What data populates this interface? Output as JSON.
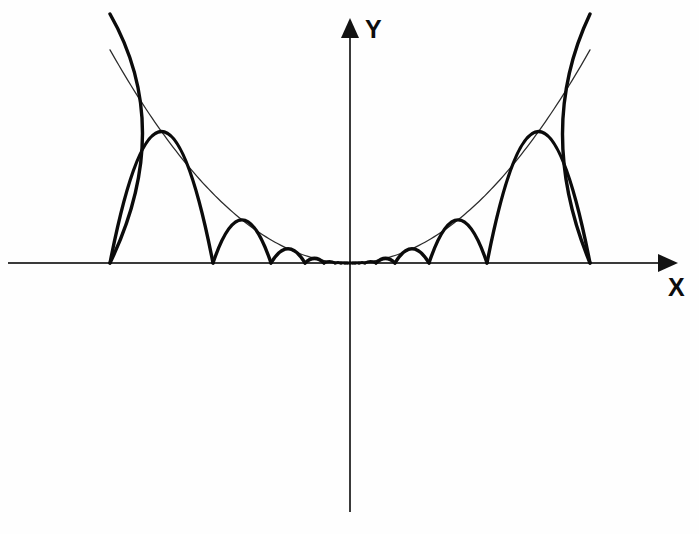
{
  "figure": {
    "background_color": "#fefefe",
    "width": 699,
    "height": 534
  },
  "axes": {
    "origin": {
      "x": 350,
      "y": 263
    },
    "x_axis": {
      "label": "X",
      "label_position": {
        "x": 668,
        "y": 296
      },
      "start": {
        "x": 8,
        "y": 263
      },
      "end": {
        "x": 678,
        "y": 263
      },
      "color": "#3a3a3a",
      "arrow": "right",
      "arrow_tip": {
        "x": 678,
        "y": 263
      }
    },
    "y_axis": {
      "label": "Y",
      "label_position": {
        "x": 365,
        "y": 38
      },
      "start": {
        "x": 350,
        "y": 512
      },
      "end": {
        "x": 350,
        "y": 18
      },
      "color": "#3a3a3a",
      "arrow": "up",
      "arrow_tip": {
        "x": 350,
        "y": 18
      }
    }
  },
  "chart_data": {
    "type": "line",
    "xlabel": "X",
    "ylabel": "Y",
    "grid": false,
    "legend": "none",
    "origin_px": {
      "x": 350,
      "y": 263
    },
    "envelope": {
      "name": "envelope parabola",
      "equation": "y = a * x^2",
      "curvature_a_px": 0.0037,
      "stroke_color": "#2b2b2b",
      "stroke_width": 1.25,
      "x_extent_px": [
        -240,
        240
      ],
      "vertex_px": {
        "x": 350,
        "y": 263
      }
    },
    "arc_chain": {
      "name": "self-similar arc chain",
      "stroke_color": "#0b0b0b",
      "stroke_width": 3.4,
      "geometric_ratio": 0.58,
      "cusp_offsets_px": [
        240,
        137,
        79,
        45,
        26,
        15,
        9,
        5,
        3
      ],
      "outer_branch_exit_left_px": {
        "x": 110,
        "y": 14
      },
      "outer_branch_exit_right_px": {
        "x": 590,
        "y": 14
      },
      "envelope_crossing_left_px": {
        "x": 175,
        "y": 128
      },
      "envelope_crossing_right_px": {
        "x": 535,
        "y": 130
      },
      "accumulation_point_px": {
        "x": 350,
        "y": 263
      },
      "symmetry": "even / mirror about the Y axis"
    }
  }
}
